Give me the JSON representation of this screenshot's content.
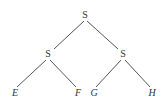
{
  "tree": {
    "nodes": [
      {
        "id": "root",
        "label": "S",
        "x": 85,
        "y": 18,
        "italic": false
      },
      {
        "id": "left",
        "label": "S",
        "x": 48,
        "y": 57,
        "italic": false
      },
      {
        "id": "right",
        "label": "S",
        "x": 123,
        "y": 57,
        "italic": false
      },
      {
        "id": "E",
        "label": "E",
        "x": 15,
        "y": 96,
        "italic": true
      },
      {
        "id": "F",
        "label": "F",
        "x": 78,
        "y": 96,
        "italic": true
      },
      {
        "id": "G",
        "label": "G",
        "x": 94,
        "y": 96,
        "italic": true
      },
      {
        "id": "H",
        "label": "H",
        "x": 152,
        "y": 96,
        "italic": true
      }
    ],
    "edges": [
      {
        "from": "root",
        "to": "left"
      },
      {
        "from": "root",
        "to": "right"
      },
      {
        "from": "left",
        "to": "E"
      },
      {
        "from": "left",
        "to": "F"
      },
      {
        "from": "right",
        "to": "G"
      },
      {
        "from": "right",
        "to": "H"
      }
    ]
  }
}
